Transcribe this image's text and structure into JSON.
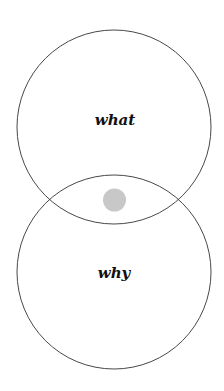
{
  "diagram": {
    "type": "venn",
    "circles": [
      {
        "label": "what",
        "cx": 114,
        "cy": 127,
        "r": 97
      },
      {
        "label": "why",
        "cx": 114,
        "cy": 272,
        "r": 97
      }
    ],
    "intersection_marker": {
      "cx": 114.5,
      "cy": 200,
      "r": 11.5,
      "color": "#c8c8c8"
    },
    "stroke_color": "#333333"
  }
}
